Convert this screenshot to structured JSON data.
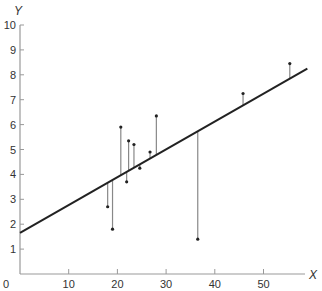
{
  "chart_data": {
    "type": "scatter",
    "title": "",
    "xlabel": "X",
    "ylabel": "Y",
    "xlim": [
      0,
      60
    ],
    "ylim": [
      0,
      10
    ],
    "grid": false,
    "legend": null,
    "x_ticks": [
      0,
      10,
      20,
      30,
      40,
      50
    ],
    "y_ticks": [
      1,
      2,
      3,
      4,
      5,
      6,
      7,
      8,
      9,
      10
    ],
    "origin_label": "0",
    "points": [
      {
        "x": 18.0,
        "y": 2.7
      },
      {
        "x": 19.0,
        "y": 1.8
      },
      {
        "x": 20.7,
        "y": 5.9
      },
      {
        "x": 21.9,
        "y": 3.7
      },
      {
        "x": 22.3,
        "y": 5.35
      },
      {
        "x": 23.4,
        "y": 5.2
      },
      {
        "x": 24.6,
        "y": 4.25
      },
      {
        "x": 26.7,
        "y": 4.9
      },
      {
        "x": 28.0,
        "y": 6.35
      },
      {
        "x": 36.5,
        "y": 1.4
      },
      {
        "x": 45.8,
        "y": 7.25
      },
      {
        "x": 55.4,
        "y": 8.45
      }
    ],
    "regression_line": {
      "x0": 0,
      "y0": 1.65,
      "x1": 59,
      "y1": 8.25,
      "slope": 0.112,
      "intercept": 1.65
    },
    "residual_lines": true,
    "annotations": []
  },
  "colors": {
    "line": "#222222",
    "axis": "#999999",
    "residual": "#888888",
    "point": "#222222",
    "text": "#333333"
  }
}
